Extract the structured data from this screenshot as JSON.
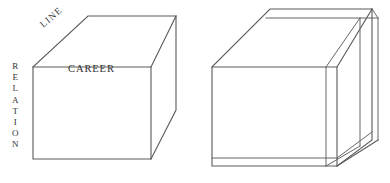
{
  "figure": {
    "background_color": "#ffffff",
    "line_color": "#5a5a5a",
    "text_color": "#333333",
    "labels": {
      "career": "CAREER",
      "line": "LINE",
      "relation_letters": [
        "R",
        "E",
        "L",
        "A",
        "T",
        "I",
        "O",
        "N"
      ]
    },
    "shapes": {
      "left_cube": {
        "name": "plain-cube",
        "front_face": "33,67 151,67 151,159 33,159",
        "top_face": "33,67 88,16 176,16 151,67",
        "right_face": "151,67 176,16 176,110 151,159"
      },
      "right_cube": {
        "name": "layered-cube",
        "front_face": "212,67 337,67 337,166 212,166",
        "top_face": "212,67 270,9 372,9 337,67",
        "right_face": "337,67 372,9 372,140 337,166",
        "top_slab_line": "221,58 378,58",
        "right_slab_lines": "2 parallel vertical lines at right edge",
        "bottom_slab_line": "212,160 337,160"
      }
    }
  }
}
